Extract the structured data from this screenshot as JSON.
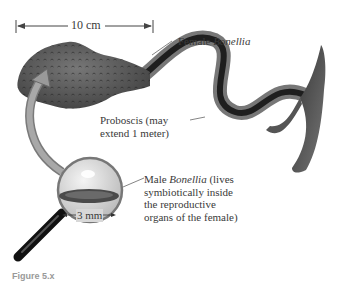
{
  "figure": {
    "scale_top": "10 cm",
    "scale_male": "3 mm",
    "labels": {
      "female_prefix": "Female ",
      "female_genus": "Bonellia",
      "proboscis_line1": "Proboscis (may",
      "proboscis_line2": "extend 1 meter)",
      "male_prefix": "Male ",
      "male_genus": "Bonellia",
      "male_suffix": " (lives",
      "male_line2": "symbiotically inside",
      "male_line3": "the reproductive",
      "male_line4": "organs of the female)"
    },
    "caption": "Figure 5.x"
  },
  "colors": {
    "body": "#5a5a5a",
    "proboscis_dark": "#1e1e1e",
    "proboscis_light": "#707070",
    "arrow": "#9a9a9a",
    "text": "#3a3a3a"
  }
}
